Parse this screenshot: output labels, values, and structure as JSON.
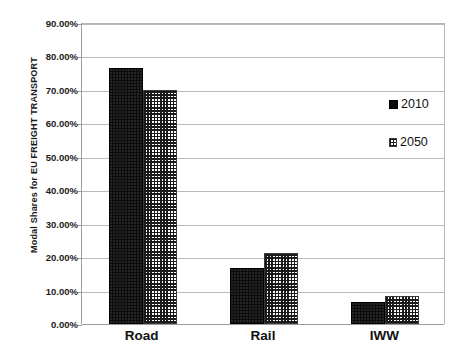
{
  "chart_data": {
    "type": "bar",
    "title": "",
    "subtitle": "",
    "xlabel": "",
    "ylabel": "Modal Shares  for EU  FREIGHT TRANSPORT",
    "categories": [
      "Road",
      "Rail",
      "IWW"
    ],
    "series": [
      {
        "name": "2010",
        "values": [
          76.5,
          16.8,
          6.5
        ],
        "marker": "solid-black-square"
      },
      {
        "name": "2050",
        "values": [
          70.0,
          21.3,
          8.5
        ],
        "marker": "checkered-square"
      }
    ],
    "ylim": [
      0,
      90
    ],
    "ytick_step": 10,
    "ytick_labels": [
      "0.00%",
      "10.00%",
      "20.00%",
      "30.00%",
      "40.00%",
      "50.00%",
      "60.00%",
      "70.00%",
      "80.00%",
      "90.00%"
    ],
    "ytick_values": [
      0,
      10,
      20,
      30,
      40,
      50,
      60,
      70,
      80,
      90
    ],
    "value_suffix": "%",
    "grid": {
      "horizontal": true,
      "vertical": false
    },
    "legend": {
      "position": "top-right-inside",
      "entries": [
        "2010",
        "2050"
      ]
    },
    "colors": {
      "series_2010": "#0c0c0c",
      "series_2050_pattern": "#1a1a1a",
      "series_2050_background": "#ffffff",
      "gridline": "#b9b9b9",
      "axis": "#9a9a9a",
      "text": "#111111",
      "plot_background": "#ffffff"
    }
  }
}
